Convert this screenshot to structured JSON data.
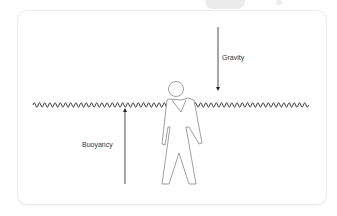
{
  "diagram": {
    "title": "",
    "forces": [
      {
        "id": "gravity",
        "label": "Gravity",
        "direction": "down"
      },
      {
        "id": "buoyancy",
        "label": "Buoyancy",
        "direction": "up"
      }
    ],
    "elements": [
      "water-surface-wave",
      "human-figure"
    ],
    "colors": {
      "stroke": "#333333",
      "figure_stroke": "#777777",
      "frame_border": "#ececec",
      "background": "#ffffff"
    }
  }
}
